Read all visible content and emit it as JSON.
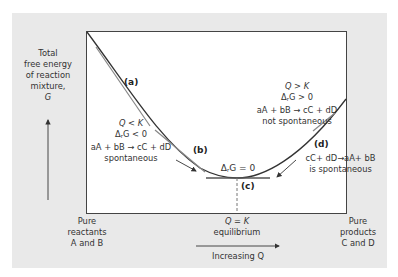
{
  "y_axis_label": [
    "Total",
    "free energy",
    "of reaction",
    "mixture,",
    "G"
  ],
  "x_axis_label": "Increasing Q",
  "left_end_label": [
    "Pure",
    "reactants",
    "A and B"
  ],
  "right_end_label": [
    "Pure",
    "products",
    "C and D"
  ],
  "equilibrium_label": {
    "line1": "Q = K",
    "line2": "equilibrium"
  },
  "points": {
    "a": "(a)",
    "b": "(b)",
    "c": "(c)",
    "d": "(d)"
  },
  "left_region": {
    "line1": "Q < K",
    "line2_pre": "Δ",
    "line2_sub": "r",
    "line2_post": "G < 0",
    "line3": "aA + bB → cC + dD",
    "line4": "spontaneous"
  },
  "right_region": {
    "line1": "Q > K",
    "line2_pre": "Δ",
    "line2_sub": "r",
    "line2_post": "G > 0",
    "line3": "aA + bB → cC + dD",
    "line4": "not spontaneous"
  },
  "minimum_label": {
    "pre": "Δ",
    "sub": "r",
    "post": "G = 0"
  },
  "reverse_label": {
    "line1": "cC+ dD→aA+ bB",
    "line2": "is spontaneous"
  },
  "colors": {
    "panel": "#e9e9e9",
    "curve": "#333333",
    "tangent": "#777777"
  }
}
